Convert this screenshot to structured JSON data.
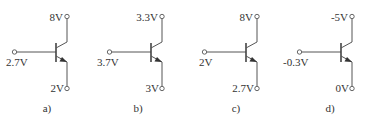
{
  "figure": {
    "circuits": [
      {
        "id": "a",
        "caption": "a)",
        "type": "NPN",
        "base_voltage": "2.7V",
        "collector_voltage": "8V",
        "emitter_voltage": "2V",
        "offset_x": 0
      },
      {
        "id": "b",
        "caption": "b)",
        "type": "NPN",
        "base_voltage": "3.7V",
        "collector_voltage": "3.3V",
        "emitter_voltage": "3V",
        "offset_x": 95
      },
      {
        "id": "c",
        "caption": "c)",
        "type": "NPN",
        "base_voltage": "2V",
        "collector_voltage": "8V",
        "emitter_voltage": "2.7V",
        "offset_x": 190
      },
      {
        "id": "d",
        "caption": "d)",
        "type": "NPN",
        "base_voltage": "-0.3V",
        "collector_voltage": "-5V",
        "emitter_voltage": "0V",
        "offset_x": 285
      }
    ]
  }
}
